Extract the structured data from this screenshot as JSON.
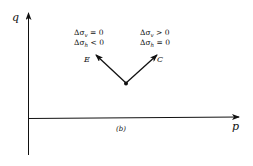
{
  "diagram": {
    "caption": "(b)",
    "axes": {
      "x_label": "p",
      "y_label": "q"
    },
    "origin_point": {
      "x": 126,
      "y": 83
    },
    "paths": [
      {
        "id": "E",
        "label": "E",
        "direction": "upper-left",
        "condition_line1": {
          "sym": "Δσ",
          "sub": "v",
          "rel": " = 0"
        },
        "condition_line2": {
          "sym": "Δσ",
          "sub": "h",
          "rel": " < 0"
        }
      },
      {
        "id": "C",
        "label": "C",
        "direction": "upper-right",
        "condition_line1": {
          "sym": "Δσ",
          "sub": "v",
          "rel": " > 0"
        },
        "condition_line2": {
          "sym": "Δσ",
          "sub": "h",
          "rel": " = 0"
        }
      }
    ],
    "colors": {
      "ink": "#111111",
      "background": "#ffffff"
    }
  }
}
